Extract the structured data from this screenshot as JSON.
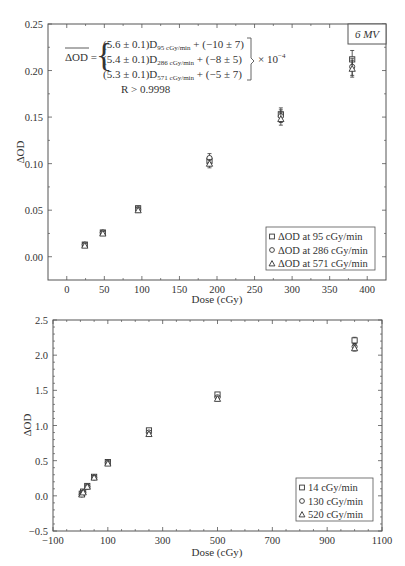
{
  "chart_data": [
    {
      "type": "scatter",
      "title": "",
      "annotation_box": "6 MV",
      "xlabel": "Dose (cGy)",
      "ylabel": "ΔOD",
      "xlim": [
        -25,
        425
      ],
      "ylim": [
        -0.025,
        0.25
      ],
      "x_ticks": [
        "0",
        "50",
        "100",
        "150",
        "200",
        "250",
        "300",
        "350",
        "400"
      ],
      "y_ticks": [
        "0.00",
        "0.05",
        "0.10",
        "0.15",
        "0.20",
        "0.25"
      ],
      "equation": {
        "lhs": "ΔOD =",
        "lines": [
          {
            "coef": "(5.6 ± 0.1)D",
            "sub": "95 cGy/min",
            "rest": " + (−10 ± 7)"
          },
          {
            "coef": "(5.4 ± 0.1)D",
            "sub": "286 cGy/min",
            "rest": " + (−8 ± 5)"
          },
          {
            "coef": "(5.3 ± 0.1)D",
            "sub": "571 cGy/min",
            "rest": " + (−5 ± 7)"
          }
        ],
        "scale": "× 10",
        "scale_exp": "−4",
        "r_text": "R > 0.9998"
      },
      "legend": [
        "ΔOD at 95 cGy/min",
        "ΔOD at 286 cGy/min",
        "ΔOD at 571 cGy/min"
      ],
      "legend_position": "lower right",
      "x": [
        24,
        48,
        95,
        190,
        285,
        380
      ],
      "series": [
        {
          "name": "ΔOD at 95 cGy/min",
          "marker": "square",
          "values": [
            0.013,
            0.026,
            0.052,
            0.103,
            0.153,
            0.212
          ]
        },
        {
          "name": "ΔOD at 286 cGy/min",
          "marker": "circle",
          "values": [
            0.013,
            0.026,
            0.051,
            0.106,
            0.151,
            0.204
          ]
        },
        {
          "name": "ΔOD at 571 cGy/min",
          "marker": "triangle",
          "values": [
            0.012,
            0.025,
            0.05,
            0.1,
            0.148,
            0.202
          ]
        }
      ]
    },
    {
      "type": "scatter",
      "title": "",
      "xlabel": "Dose (cGy)",
      "ylabel": "ΔOD",
      "xlim": [
        -100,
        1100
      ],
      "ylim": [
        -0.5,
        2.5
      ],
      "x_ticks": [
        "−100",
        "100",
        "300",
        "500",
        "700",
        "900",
        "1100"
      ],
      "y_ticks": [
        "−0.5",
        "0.0",
        "0.5",
        "1.0",
        "1.5",
        "2.0",
        "2.5"
      ],
      "legend": [
        "14 cGy/min",
        "130 cGy/min",
        "520 cGy/min"
      ],
      "legend_position": "lower right",
      "x": [
        5,
        10,
        25,
        50,
        100,
        250,
        500,
        1000
      ],
      "series": [
        {
          "name": "14 cGy/min",
          "marker": "square",
          "values": [
            0.03,
            0.06,
            0.14,
            0.27,
            0.48,
            0.93,
            1.44,
            2.21
          ]
        },
        {
          "name": "130 cGy/min",
          "marker": "circle",
          "values": [
            0.02,
            0.05,
            0.13,
            0.26,
            0.47,
            0.9,
            1.4,
            2.12
          ]
        },
        {
          "name": "520 cGy/min",
          "marker": "triangle",
          "values": [
            0.02,
            0.05,
            0.13,
            0.26,
            0.46,
            0.88,
            1.38,
            2.1
          ]
        }
      ]
    }
  ]
}
